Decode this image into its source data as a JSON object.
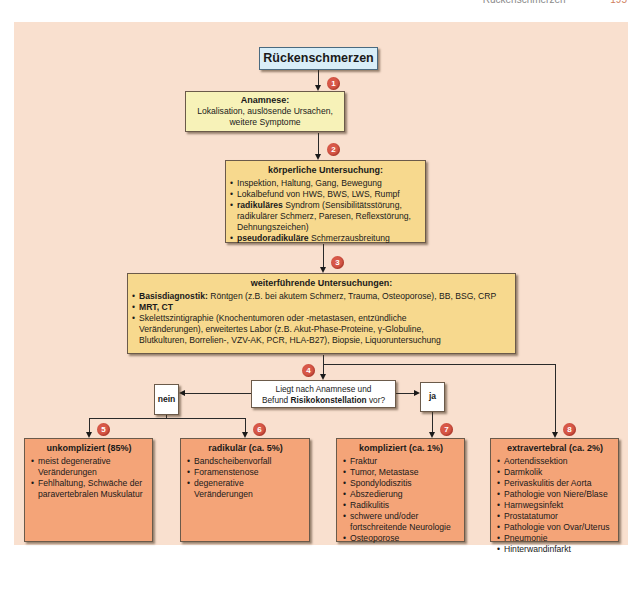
{
  "page_header": {
    "title": "Rückenschmerzen",
    "page_number": "195"
  },
  "flowchart": {
    "start": "Rückenschmerzen",
    "steps": [
      {
        "badge": "1"
      },
      {
        "badge": "2"
      },
      {
        "badge": "3"
      },
      {
        "badge": "4"
      },
      {
        "badge": "5"
      },
      {
        "badge": "6"
      },
      {
        "badge": "7"
      },
      {
        "badge": "8"
      }
    ],
    "anamnese": {
      "title": "Anamnese:",
      "line1": "Lokalisation, auslösende Ursachen,",
      "line2": "weitere Symptome"
    },
    "koerperlich": {
      "title": "körperliche Untersuchung:",
      "items": [
        {
          "bold": "",
          "text": "Inspektion, Haltung, Gang, Bewegung"
        },
        {
          "bold": "",
          "text": "Lokalbefund von HWS, BWS, LWS, Rumpf"
        },
        {
          "bold": "radikuläres",
          "text": " Syndrom (Sensibilitätsstörung, radikulärer Schmerz, Paresen, Reflexstörung, Dehnungszeichen)"
        },
        {
          "bold": "pseudoradikuläre",
          "text": " Schmerzausbreitung"
        }
      ]
    },
    "weiter": {
      "title": "weiterführende Untersuchungen:",
      "items": [
        {
          "bold": "Basisdiagnostik:",
          "text": " Röntgen (z.B. bei akutem Schmerz, Trauma, Osteoporose), BB, BSG, CRP"
        },
        {
          "bold": "MRT, CT",
          "text": ""
        },
        {
          "bold": "",
          "text": "Skelettszintigraphie (Knochentumoren oder -metastasen, entzündliche Veränderungen), erweitertes Labor (z.B. Akut-Phase-Proteine, γ-Globuline, Blutkulturen, Borrelien-, VZV-AK, PCR, HLA-B27), Biopsie, Liquoruntersuchung"
        }
      ]
    },
    "question": {
      "line1": "Liegt nach Anamnese und",
      "pre": "Befund ",
      "bold": "Risikokonstellation",
      "post": " vor?"
    },
    "no_label": "nein",
    "yes_label": "ja",
    "outcomes": [
      {
        "title": "unkompliziert (85%)",
        "items": [
          "meist degenerative Veränderungen",
          "Fehlhaltung, Schwäche der paravertebralen Muskulatur"
        ]
      },
      {
        "title": "radikulär (ca. 5%)",
        "items": [
          "Bandscheibenvorfall",
          "Foramenstenose",
          "degenerative Veränderungen"
        ]
      },
      {
        "title": "kompliziert (ca. 1%)",
        "items": [
          "Fraktur",
          "Tumor, Metastase",
          "Spondylodiszitis",
          "Abszedierung",
          "Radikulitis",
          "schwere und/oder fortschreitende Neurologie",
          "Osteoporose"
        ]
      },
      {
        "title": "extravertebral (ca. 2%)",
        "items": [
          "Aortendissektion",
          "Darmkolik",
          "Perivaskulitis der Aorta",
          "Pathologie von Niere/Blase",
          "Harnwegsinfekt",
          "Prostatatumor",
          "Pathologie von Ovar/Uterus",
          "Pneumonie",
          "Hinterwandinfarkt"
        ]
      }
    ]
  },
  "colors": {
    "panel_bg": "#f9e0cf",
    "start_box": "#d9eef8",
    "anamnese_box": "#f7f2b8",
    "exam_box": "#f7d98e",
    "outcome_box": "#f4a478",
    "badge": "#d85848"
  }
}
